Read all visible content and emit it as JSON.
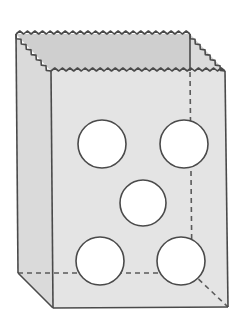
{
  "figure": {
    "colors": {
      "background": "#ffffff",
      "front_face": "#e4e4e4",
      "side_face": "#dadada",
      "inner_back": "#cfcfcf",
      "outline": "#4a4a4a",
      "hidden_edge": "#5a5a5a",
      "hole": "#ffffff"
    },
    "vertices": {
      "back_left_top": [
        16,
        34
      ],
      "back_right_top": [
        190,
        34
      ],
      "front_left_top": [
        51,
        71
      ],
      "front_right_top": [
        225,
        71
      ],
      "back_left_bottom": [
        18,
        273
      ],
      "back_right_bottom": [
        192,
        273
      ],
      "front_left_bottom": [
        53,
        308
      ],
      "front_right_bottom": [
        228,
        307
      ]
    },
    "holes": [
      {
        "name": "top-left",
        "cx": 102,
        "cy": 144,
        "r": 24
      },
      {
        "name": "top-right",
        "cx": 184,
        "cy": 144,
        "r": 24
      },
      {
        "name": "center",
        "cx": 143,
        "cy": 203,
        "r": 23
      },
      {
        "name": "bottom-left",
        "cx": 100,
        "cy": 261,
        "r": 24
      },
      {
        "name": "bottom-right",
        "cx": 181,
        "cy": 261,
        "r": 24
      }
    ],
    "hole_count": 5
  }
}
